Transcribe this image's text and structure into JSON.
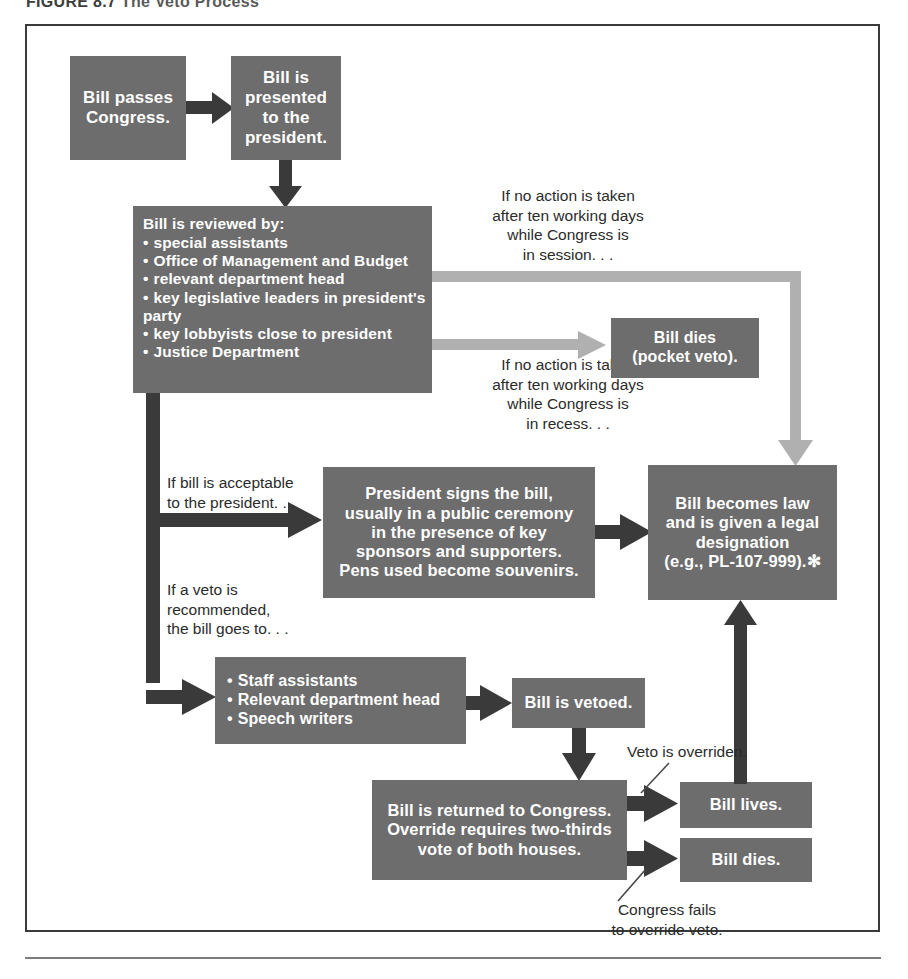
{
  "figure": {
    "number": "FIGURE 8.7",
    "caption": "The Veto Process"
  },
  "colors": {
    "box_fill": "#6d6d6d",
    "box_text": "#ffffff",
    "arrow_dark": "#3a3a3a",
    "arrow_gray": "#b0b0b0",
    "label_text": "#2b2b2b",
    "frame_border": "#3a3a3a",
    "page_background": "#ffffff"
  },
  "nodes": {
    "bill_passes": {
      "id": "bill-passes-congress",
      "lines": [
        "Bill passes",
        "Congress."
      ]
    },
    "bill_presented": {
      "id": "bill-presented-to-president",
      "lines": [
        "Bill is",
        "presented",
        "to the",
        "president."
      ]
    },
    "bill_reviewed": {
      "id": "bill-is-reviewed-by",
      "heading": "Bill is reviewed by:",
      "items": [
        "special assistants",
        "Office of Management and Budget",
        "relevant department head",
        "key legislative leaders in president's",
        "party",
        "key lobbyists close to president",
        "Justice Department"
      ],
      "bullet_flags": [
        true,
        true,
        true,
        true,
        false,
        true,
        true
      ]
    },
    "pocket_veto": {
      "id": "bill-dies-pocket-veto",
      "lines": [
        "Bill dies",
        "(pocket veto)."
      ]
    },
    "president_signs": {
      "id": "president-signs-the-bill",
      "lines": [
        "President signs the bill,",
        "usually in a public ceremony",
        "in the presence of key",
        "sponsors and supporters.",
        "Pens used become souvenirs."
      ]
    },
    "becomes_law": {
      "id": "bill-becomes-law",
      "lines": [
        "Bill becomes law",
        "and is given a legal",
        "designation",
        "(e.g., PL-107-999).✻"
      ]
    },
    "staff": {
      "id": "staff-assistants-group",
      "items": [
        "Staff assistants",
        "Relevant department head",
        "Speech writers"
      ]
    },
    "bill_vetoed": {
      "id": "bill-is-vetoed",
      "lines": [
        "Bill is vetoed."
      ]
    },
    "returned_to_congress": {
      "id": "bill-returned-to-congress",
      "lines": [
        "Bill is returned to Congress.",
        "Override requires two-thirds",
        "vote of both houses."
      ]
    },
    "bill_lives": {
      "id": "bill-lives",
      "lines": [
        "Bill lives."
      ]
    },
    "bill_dies": {
      "id": "bill-dies",
      "lines": [
        "Bill dies."
      ]
    }
  },
  "edge_labels": {
    "no_action_session": "If no action is taken\nafter ten working days\nwhile Congress is\nin session. . .",
    "no_action_recess": "If no action is taken\nafter ten working days\nwhile Congress is\nin recess. . .",
    "acceptable": "If bill is acceptable\nto the president. . .",
    "veto_recommended": "If a veto is\nrecommended,\nthe bill goes to. . .",
    "veto_overridden": "Veto is overriden.",
    "congress_fails": "Congress fails\nto override veto."
  }
}
